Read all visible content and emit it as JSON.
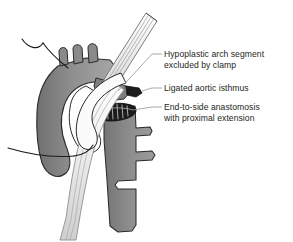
{
  "figure": {
    "type": "medical-line-illustration",
    "background_color": "#ffffff",
    "palette": {
      "vessel_fill": "#8a8a8a",
      "vessel_fill_light": "#a6a6a6",
      "vessel_fill_dark": "#6e6e6e",
      "vessel_outline": "#2b2b2b",
      "clamp_fill": "#f2f2f2",
      "clamp_line": "#8d8d8d",
      "suture_thread": "#1a1a1a",
      "anastomosis_dark": "#1c1c1c",
      "leader_line": "#9a9a9a",
      "text_color": "#231f20"
    },
    "structures": [
      {
        "name": "ascending-aorta",
        "description": "Ascending aorta curving up and left"
      },
      {
        "name": "aortic-arch",
        "description": "Aortic arch with three brachiocephalic branch vessels"
      },
      {
        "name": "arch-branch-vessel-1",
        "description": "Innominate artery stump"
      },
      {
        "name": "arch-branch-vessel-2",
        "description": "Left common carotid artery stump"
      },
      {
        "name": "arch-branch-vessel-3",
        "description": "Left subclavian artery stump"
      },
      {
        "name": "descending-aorta",
        "description": "Descending thoracic aorta with intercostal branches"
      },
      {
        "name": "intercostal-branch-1",
        "description": "Upper intercostal artery"
      },
      {
        "name": "intercostal-branch-2",
        "description": "Middle intercostal artery"
      },
      {
        "name": "intercostal-branch-3",
        "description": "Lower intercostal artery"
      },
      {
        "name": "vascular-clamp",
        "description": "Diagonal vascular clamp excluding hypoplastic arch"
      },
      {
        "name": "ligature-stub",
        "description": "Dark ligated aortic isthmus stump"
      },
      {
        "name": "anastomosis-suture-line",
        "description": "Dark elliptical end-to-side anastomosis with running suture"
      },
      {
        "name": "suture-needle-thread",
        "description": "Curved suture needle with trailing thread, upper left"
      }
    ]
  },
  "annotations": {
    "labels": [
      {
        "id": "hypoplastic-arch-segment",
        "lines": [
          "Hypoplastic arch segment",
          "excluded by clamp"
        ],
        "text": "Hypoplastic arch segment\nexcluded by clamp",
        "leader": {
          "x1": 152,
          "y1": 54,
          "x2": 162,
          "y2": 54
        }
      },
      {
        "id": "ligated-aortic-isthmus",
        "lines": [
          "Ligated aortic isthmus"
        ],
        "text": "Ligated aortic isthmus",
        "leader": {
          "x1": 152,
          "y1": 88,
          "x2": 162,
          "y2": 88
        }
      },
      {
        "id": "end-to-side-anastomosis",
        "lines": [
          "End-to-side anastomosis",
          "with proximal extension"
        ],
        "text": "End-to-side anastomosis\nwith proximal extension",
        "leader": {
          "x1": 152,
          "y1": 107,
          "x2": 162,
          "y2": 107
        }
      }
    ]
  }
}
